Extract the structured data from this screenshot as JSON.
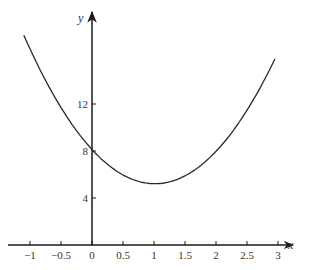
{
  "chart_data": {
    "type": "line",
    "title": "",
    "xlabel": "x",
    "ylabel": "y",
    "xlim": [
      -1.1,
      3.2
    ],
    "ylim": [
      0,
      20
    ],
    "grid": false,
    "legend": null,
    "x_ticks": [
      -1,
      -0.5,
      0,
      0.5,
      1,
      1.5,
      2,
      2.5,
      3
    ],
    "x_tick_labels": [
      "−1",
      "−0.5",
      "0",
      "0.5",
      "1",
      "1.5",
      "2",
      "2.5",
      "3"
    ],
    "y_ticks": [
      4,
      8,
      12
    ],
    "y_tick_labels": [
      "4",
      "8",
      "12"
    ],
    "series": [
      {
        "name": "curve",
        "description": "parabola with minimum near (1, 5), y-intercept 8",
        "x": [
          -1.1,
          -1,
          -0.5,
          0,
          0.5,
          1,
          1.5,
          2,
          2.5,
          2.95
        ],
        "y": [
          17.6,
          16.9,
          11.9,
          8.0,
          5.9,
          5.2,
          5.9,
          8.0,
          11.5,
          15.8
        ]
      }
    ],
    "colors": {
      "line": "#2a2a2a",
      "axis": "#1a1a1a"
    }
  }
}
